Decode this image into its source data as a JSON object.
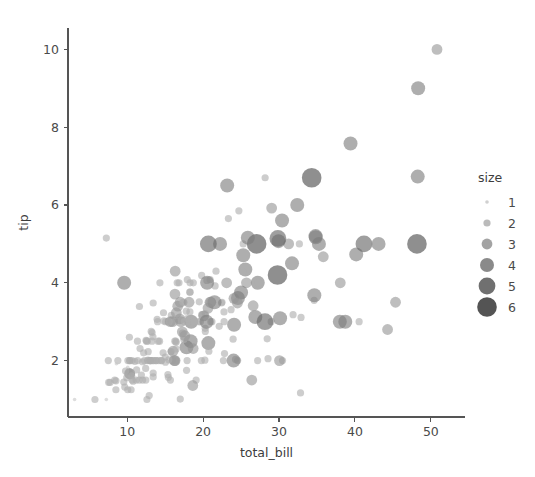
{
  "chart_data": {
    "type": "scatter",
    "title": "",
    "xlabel": "total_bill",
    "ylabel": "tip",
    "xlim": [
      2.2,
      54.5
    ],
    "ylim": [
      0.55,
      10.55
    ],
    "xticks": [
      10,
      20,
      30,
      40,
      50
    ],
    "yticks": [
      2,
      4,
      6,
      8,
      10
    ],
    "xticklabels": [
      "10",
      "20",
      "30",
      "40",
      "50"
    ],
    "yticklabels": [
      "2",
      "4",
      "6",
      "8",
      "10"
    ],
    "grid": false,
    "legend": {
      "title": "size",
      "position": "right",
      "entries": [
        {
          "label": "1",
          "radius": 1.8,
          "color": "#c8c8c8",
          "opacity": 0.85
        },
        {
          "label": "2",
          "radius": 3.6,
          "color": "#afafaf",
          "opacity": 0.85
        },
        {
          "label": "3",
          "radius": 5.4,
          "color": "#969696",
          "opacity": 0.88
        },
        {
          "label": "4",
          "radius": 7.0,
          "color": "#7d7d7d",
          "opacity": 0.9
        },
        {
          "label": "5",
          "radius": 8.4,
          "color": "#646464",
          "opacity": 0.92
        },
        {
          "label": "6",
          "radius": 9.8,
          "color": "#4b4b4b",
          "opacity": 0.95
        }
      ]
    },
    "size_encoding": {
      "variable": "size",
      "values": [
        1,
        2,
        3,
        4,
        5,
        6
      ],
      "radii": [
        1.8,
        3.6,
        5.4,
        7.0,
        8.4,
        9.8
      ],
      "colors": [
        "#c8c8c8",
        "#afafaf",
        "#969696",
        "#7d7d7d",
        "#646464",
        "#4b4b4b"
      ]
    },
    "marker_opacity": 0.62,
    "series_name": "tips",
    "x": [
      16.99,
      10.34,
      21.01,
      23.68,
      24.59,
      25.29,
      8.77,
      26.88,
      15.04,
      14.78,
      10.27,
      35.26,
      15.42,
      18.43,
      14.83,
      21.58,
      10.33,
      16.29,
      16.97,
      20.65,
      17.92,
      20.29,
      15.77,
      39.42,
      19.82,
      17.81,
      13.37,
      12.69,
      21.7,
      19.65,
      9.55,
      18.35,
      15.06,
      20.69,
      17.78,
      24.06,
      16.31,
      16.93,
      18.69,
      31.27,
      16.04,
      17.46,
      13.94,
      9.68,
      30.4,
      18.29,
      22.23,
      32.4,
      28.55,
      18.04,
      12.54,
      10.29,
      34.81,
      9.94,
      25.56,
      19.49,
      38.01,
      26.41,
      11.24,
      48.27,
      20.29,
      13.81,
      11.02,
      18.29,
      17.59,
      20.08,
      16.45,
      3.07,
      20.23,
      15.01,
      12.02,
      17.07,
      26.86,
      25.28,
      14.73,
      10.51,
      17.92,
      27.2,
      22.76,
      17.29,
      19.44,
      16.66,
      10.07,
      32.68,
      15.98,
      34.83,
      13.03,
      18.28,
      24.71,
      21.16,
      28.97,
      22.49,
      5.75,
      16.32,
      22.75,
      40.17,
      27.28,
      12.03,
      21.01,
      12.46,
      11.35,
      15.38,
      44.3,
      22.42,
      20.92,
      15.36,
      20.49,
      25.21,
      18.24,
      14.31,
      14.0,
      7.25,
      38.07,
      23.95,
      25.71,
      17.31,
      29.93,
      10.65,
      12.43,
      24.08,
      11.69,
      13.42,
      14.26,
      15.95,
      12.48,
      29.8,
      8.52,
      14.52,
      11.38,
      22.82,
      19.08,
      20.27,
      11.17,
      12.26,
      18.26,
      8.51,
      10.33,
      14.15,
      16.0,
      13.16,
      17.47,
      34.3,
      41.19,
      27.05,
      16.43,
      8.35,
      18.64,
      11.87,
      9.78,
      7.51,
      14.07,
      13.13,
      17.26,
      24.55,
      19.77,
      29.85,
      48.17,
      25.0,
      13.39,
      16.49,
      21.5,
      12.66,
      16.21,
      13.81,
      17.51,
      24.52,
      20.76,
      31.71,
      10.59,
      10.63,
      50.81,
      15.81,
      7.25,
      31.85,
      16.82,
      32.9,
      17.89,
      14.48,
      9.6,
      34.63,
      34.65,
      23.33,
      45.35,
      23.17,
      40.55,
      20.69,
      20.9,
      30.46,
      18.15,
      23.1,
      15.69,
      19.81,
      28.44,
      15.48,
      16.58,
      7.56,
      10.34,
      43.11,
      13.0,
      13.51,
      18.71,
      12.74,
      13.0,
      16.4,
      20.53,
      16.47,
      26.59,
      38.73,
      24.27,
      12.76,
      30.06,
      25.89,
      48.33,
      13.27,
      28.17,
      12.9,
      28.15,
      11.59,
      7.74,
      30.14,
      12.16,
      13.42,
      8.58,
      15.98,
      13.42,
      16.27,
      10.09,
      20.45,
      13.28,
      22.12,
      24.01,
      15.69,
      11.61,
      10.77,
      15.53,
      10.07,
      12.6,
      32.83,
      35.83,
      29.03,
      27.18,
      22.67,
      17.82,
      18.78
    ],
    "y": [
      1.01,
      1.66,
      3.5,
      3.31,
      3.61,
      4.71,
      2.0,
      3.12,
      1.96,
      3.23,
      1.71,
      5.0,
      1.57,
      3.0,
      3.02,
      3.92,
      1.67,
      3.71,
      3.5,
      3.35,
      4.08,
      2.75,
      2.23,
      7.58,
      3.18,
      2.34,
      2.0,
      2.0,
      4.3,
      3.0,
      1.45,
      2.5,
      3.0,
      2.45,
      3.27,
      3.6,
      2.0,
      3.07,
      2.31,
      5.0,
      2.24,
      2.54,
      3.06,
      1.32,
      5.6,
      3.0,
      5.0,
      6.0,
      2.05,
      3.0,
      2.5,
      2.6,
      5.2,
      1.56,
      4.34,
      3.51,
      3.0,
      1.5,
      1.76,
      6.73,
      3.21,
      2.0,
      1.98,
      3.76,
      2.64,
      3.15,
      2.47,
      1.0,
      2.01,
      2.09,
      1.97,
      3.0,
      3.14,
      5.0,
      2.2,
      1.25,
      3.08,
      4.0,
      3.0,
      2.71,
      3.0,
      3.4,
      1.83,
      5.0,
      2.03,
      5.17,
      2.0,
      4.0,
      5.85,
      3.0,
      3.0,
      3.5,
      1.0,
      4.3,
      3.25,
      4.73,
      4.0,
      1.5,
      3.0,
      1.5,
      2.5,
      3.0,
      2.8,
      3.48,
      4.08,
      1.64,
      4.06,
      4.29,
      3.76,
      4.0,
      3.0,
      1.0,
      4.0,
      2.55,
      4.0,
      3.5,
      5.07,
      1.5,
      1.8,
      2.92,
      2.31,
      1.68,
      2.5,
      2.0,
      2.52,
      4.2,
      1.48,
      2.0,
      2.0,
      2.18,
      1.5,
      2.83,
      1.5,
      2.0,
      3.25,
      1.25,
      2.0,
      2.0,
      2.0,
      2.75,
      3.5,
      6.7,
      5.0,
      5.0,
      2.3,
      1.5,
      1.36,
      1.63,
      1.73,
      2.0,
      2.5,
      2.0,
      2.74,
      2.0,
      2.0,
      5.14,
      5.0,
      3.75,
      2.61,
      2.0,
      3.5,
      2.5,
      2.0,
      2.0,
      3.0,
      3.48,
      2.24,
      4.5,
      1.61,
      2.0,
      10.0,
      3.16,
      5.15,
      3.18,
      4.0,
      3.11,
      2.0,
      2.0,
      4.0,
      3.55,
      3.68,
      5.65,
      3.5,
      6.5,
      3.0,
      5.0,
      3.5,
      2.0,
      3.5,
      4.0,
      1.5,
      4.19,
      2.56,
      2.02,
      4.0,
      1.44,
      2.0,
      5.0,
      2.0,
      2.0,
      4.0,
      2.01,
      2.0,
      2.5,
      4.0,
      3.23,
      3.41,
      3.0,
      2.03,
      2.23,
      2.0,
      5.16,
      9.0,
      2.5,
      6.7,
      1.1,
      3.0,
      1.5,
      1.44,
      3.09,
      2.2,
      3.48,
      1.92,
      3.0,
      1.58,
      2.5,
      2.0,
      3.0,
      2.72,
      2.88,
      2.0,
      3.0,
      3.39,
      1.47,
      3.0,
      1.25,
      1.0,
      1.17,
      4.67,
      5.92,
      2.0,
      2.0,
      1.75,
      3.0
    ],
    "sizes": [
      2,
      3,
      3,
      2,
      4,
      4,
      2,
      4,
      2,
      2,
      2,
      4,
      2,
      4,
      2,
      2,
      3,
      3,
      3,
      3,
      2,
      2,
      2,
      4,
      2,
      4,
      2,
      2,
      2,
      2,
      2,
      4,
      2,
      4,
      2,
      3,
      3,
      3,
      3,
      3,
      3,
      2,
      2,
      2,
      4,
      2,
      4,
      4,
      2,
      2,
      2,
      2,
      4,
      2,
      4,
      2,
      4,
      3,
      2,
      4,
      2,
      2,
      2,
      2,
      3,
      3,
      2,
      1,
      2,
      2,
      2,
      3,
      2,
      2,
      2,
      2,
      2,
      4,
      2,
      2,
      2,
      3,
      1,
      2,
      2,
      4,
      2,
      2,
      2,
      2,
      2,
      2,
      2,
      3,
      2,
      4,
      2,
      2,
      2,
      2,
      2,
      2,
      3,
      2,
      2,
      2,
      2,
      2,
      2,
      2,
      2,
      1,
      3,
      2,
      3,
      2,
      4,
      2,
      2,
      4,
      2,
      2,
      2,
      2,
      2,
      6,
      2,
      2,
      2,
      2,
      2,
      2,
      2,
      2,
      2,
      2,
      2,
      2,
      2,
      2,
      2,
      6,
      5,
      6,
      2,
      2,
      3,
      2,
      2,
      2,
      2,
      2,
      3,
      2,
      2,
      5,
      6,
      4,
      2,
      2,
      4,
      2,
      3,
      2,
      2,
      3,
      2,
      4,
      2,
      2,
      3,
      2,
      2,
      2,
      2,
      2,
      2,
      2,
      4,
      2,
      4,
      2,
      3,
      4,
      2,
      5,
      3,
      2,
      3,
      3,
      2,
      2,
      2,
      2,
      2,
      2,
      2,
      4,
      2,
      2,
      2,
      2,
      2,
      2,
      4,
      3,
      3,
      4,
      2,
      2,
      3,
      4,
      4,
      2,
      2,
      2,
      5,
      2,
      2,
      4,
      2,
      2,
      1,
      3,
      2,
      2,
      2,
      4,
      2,
      2,
      4,
      3,
      2,
      2,
      2,
      2,
      2,
      2,
      3,
      3,
      2,
      2,
      2,
      2
    ]
  },
  "axes": {
    "x_label": "total_bill",
    "y_label": "tip"
  }
}
